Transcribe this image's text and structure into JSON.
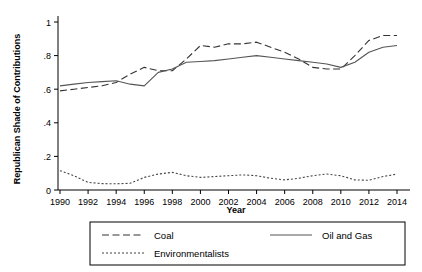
{
  "chart_data": {
    "type": "line",
    "title": "",
    "xlabel": "Year",
    "ylabel": "Republican Shade of Contributions",
    "xlim": [
      1990,
      2014
    ],
    "ylim": [
      0,
      1
    ],
    "grid": false,
    "legend_position": "bottom",
    "xticks": [
      "1990",
      "1992",
      "1994",
      "1996",
      "1998",
      "2000",
      "2002",
      "2004",
      "2006",
      "2008",
      "2010",
      "2012",
      "2014"
    ],
    "yticks": [
      "0",
      ".2",
      ".4",
      ".6",
      ".8",
      "1"
    ],
    "x": [
      1990,
      1991,
      1992,
      1993,
      1994,
      1995,
      1996,
      1997,
      1998,
      1999,
      2000,
      2001,
      2002,
      2003,
      2004,
      2005,
      2006,
      2007,
      2008,
      2009,
      2010,
      2011,
      2012,
      2013,
      2014
    ],
    "series": [
      {
        "name": "Coal",
        "style": "dashed",
        "color": "#333333",
        "values": [
          0.59,
          0.6,
          0.61,
          0.62,
          0.64,
          0.69,
          0.73,
          0.71,
          0.71,
          0.78,
          0.86,
          0.85,
          0.87,
          0.87,
          0.88,
          0.85,
          0.82,
          0.78,
          0.73,
          0.72,
          0.72,
          0.8,
          0.89,
          0.92,
          0.92
        ]
      },
      {
        "name": "Oil and Gas",
        "style": "solid",
        "color": "#555555",
        "values": [
          0.62,
          0.63,
          0.64,
          0.645,
          0.65,
          0.63,
          0.62,
          0.7,
          0.72,
          0.76,
          0.765,
          0.77,
          0.78,
          0.79,
          0.8,
          0.79,
          0.78,
          0.77,
          0.76,
          0.75,
          0.73,
          0.76,
          0.82,
          0.85,
          0.86
        ]
      },
      {
        "name": "Environmentalists",
        "style": "dotted",
        "color": "#444444",
        "values": [
          0.115,
          0.085,
          0.045,
          0.038,
          0.037,
          0.04,
          0.075,
          0.095,
          0.105,
          0.085,
          0.075,
          0.08,
          0.085,
          0.09,
          0.085,
          0.07,
          0.06,
          0.07,
          0.085,
          0.095,
          0.085,
          0.06,
          0.058,
          0.08,
          0.095
        ]
      }
    ]
  },
  "legend": {
    "items": [
      {
        "label": "Coal",
        "style": "dashed"
      },
      {
        "label": "Oil and Gas",
        "style": "solid"
      },
      {
        "label": "Environmentalists",
        "style": "dotted"
      }
    ]
  },
  "axis": {
    "x_title": "Year",
    "y_title": "Republican Shade of Contributions"
  }
}
